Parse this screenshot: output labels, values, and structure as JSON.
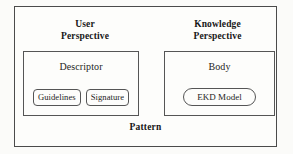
{
  "diagram": {
    "title": "Pattern",
    "outer": {
      "label": "Pattern",
      "border_color": "#4b4b4b",
      "background": "#fdfdfb"
    },
    "perspectives": [
      {
        "name": "user-perspective",
        "label_line1": "User",
        "label_line2": "Perspective",
        "container": {
          "name": "descriptor",
          "label": "Descriptor",
          "items": [
            {
              "name": "guidelines",
              "label": "Guidelines"
            },
            {
              "name": "signature",
              "label": "Signature"
            }
          ]
        }
      },
      {
        "name": "knowledge-perspective",
        "label_line1": "Knowledge",
        "label_line2": "Perspective",
        "container": {
          "name": "body",
          "label": "Body",
          "items": [
            {
              "name": "ekd-model",
              "label": "EKD Model"
            }
          ]
        }
      }
    ]
  }
}
